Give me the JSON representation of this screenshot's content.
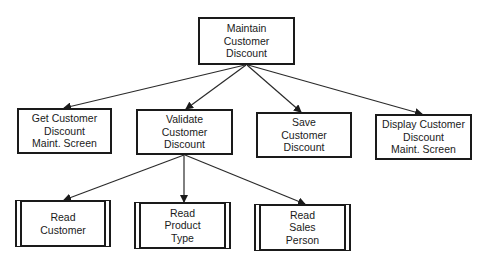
{
  "diagram": {
    "type": "structure-chart",
    "root": {
      "id": "maintain",
      "label": "Maintain\nCustomer\nDiscount",
      "box": {
        "x": 198,
        "y": 17,
        "w": 97,
        "h": 48
      }
    },
    "level1": [
      {
        "id": "get-screen",
        "label": "Get Customer\nDiscount\nMaint. Screen",
        "box": {
          "x": 17,
          "y": 108,
          "w": 95,
          "h": 46
        }
      },
      {
        "id": "validate",
        "label": "Validate\nCustomer\nDiscount",
        "box": {
          "x": 136,
          "y": 109,
          "w": 97,
          "h": 46
        }
      },
      {
        "id": "save",
        "label": "Save\nCustomer\nDiscount",
        "box": {
          "x": 256,
          "y": 112,
          "w": 96,
          "h": 46
        }
      },
      {
        "id": "display-screen",
        "label": "Display Customer\nDiscount\nMaint. Screen",
        "box": {
          "x": 375,
          "y": 114,
          "w": 97,
          "h": 46
        }
      }
    ],
    "level2": [
      {
        "id": "read-customer",
        "parent": "validate",
        "label": "Read\nCustomer",
        "predefined": true,
        "box": {
          "x": 15,
          "y": 200,
          "w": 96,
          "h": 47
        }
      },
      {
        "id": "read-product-type",
        "parent": "validate",
        "label": "Read\nProduct\nType",
        "predefined": true,
        "box": {
          "x": 134,
          "y": 202,
          "w": 97,
          "h": 47
        }
      },
      {
        "id": "read-sales-person",
        "parent": "validate",
        "label": "Read\nSales\nPerson",
        "predefined": true,
        "box": {
          "x": 254,
          "y": 204,
          "w": 97,
          "h": 47
        }
      }
    ],
    "edges": [
      {
        "from": "maintain",
        "to": "get-screen",
        "x1": 245,
        "y1": 65,
        "x2": 64,
        "y2": 108
      },
      {
        "from": "maintain",
        "to": "validate",
        "x1": 246,
        "y1": 65,
        "x2": 186,
        "y2": 109
      },
      {
        "from": "maintain",
        "to": "save",
        "x1": 247,
        "y1": 65,
        "x2": 301,
        "y2": 112
      },
      {
        "from": "maintain",
        "to": "display-screen",
        "x1": 248,
        "y1": 65,
        "x2": 422,
        "y2": 114
      },
      {
        "from": "validate",
        "to": "read-customer",
        "x1": 184,
        "y1": 155,
        "x2": 64,
        "y2": 200
      },
      {
        "from": "validate",
        "to": "read-product-type",
        "x1": 184,
        "y1": 155,
        "x2": 184,
        "y2": 202
      },
      {
        "from": "validate",
        "to": "read-sales-person",
        "x1": 185,
        "y1": 155,
        "x2": 305,
        "y2": 204
      }
    ],
    "colors": {
      "line": "#2a2a2a",
      "box_border": "#1a1a1a",
      "background": "#ffffff"
    }
  }
}
